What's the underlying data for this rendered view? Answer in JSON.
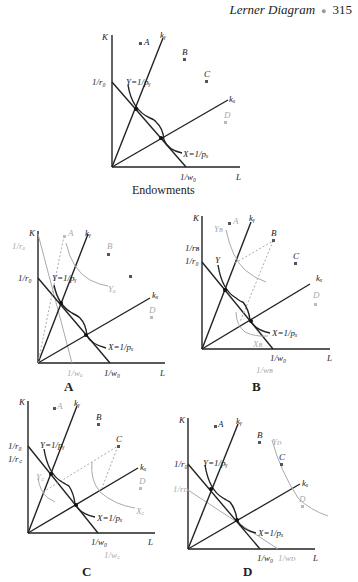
{
  "header": {
    "title": "Lerner Diagram",
    "page": "315",
    "separator": "●"
  },
  "panels": {
    "endowments": {
      "caption": "Endowments",
      "labels": {
        "k": "K",
        "l": "L",
        "r0": "1/r₀",
        "w0": "1/w₀",
        "ky": "kᵧ",
        "kx": "kₓ",
        "y": "Y=1/pᵧ",
        "x": "X=1/pₓ",
        "a": "A",
        "b": "B",
        "c": "C",
        "d": "D"
      }
    },
    "a": {
      "caption": "A",
      "labels": {
        "k": "K",
        "l": "L",
        "r0": "1/r₀",
        "ra": "1/rₐ",
        "w0": "1/w₀",
        "wa": "1/wₐ",
        "ky": "kᵧ",
        "kx": "kₓ",
        "y": "Y=1/pᵧ",
        "x": "X=1/pₓ",
        "ya": "Yₐ",
        "a": "A",
        "b": "B",
        "d": "D"
      }
    },
    "b": {
      "caption": "B",
      "labels": {
        "k": "K",
        "l": "L",
        "r0": "1/r₀",
        "rb": "1/rʙ",
        "w0": "1/w₀",
        "wb": "1/wʙ",
        "ky": "kᵧ",
        "kx": "kₓ",
        "y": "Y",
        "x": "X=1/pₓ",
        "yb": "Yʙ",
        "xb": "Xʙ",
        "a": "A",
        "b": "B",
        "c": "C",
        "d": "D"
      }
    },
    "c": {
      "caption": "C",
      "labels": {
        "k": "K",
        "l": "L",
        "r0": "1/r₀",
        "rc": "1/r꜀",
        "w0": "1/w₀",
        "wc": "1/w꜀",
        "ky": "kᵧ",
        "kx": "kₓ",
        "y": "Y=1/pᵧ",
        "x": "X=1/pₓ",
        "yc": "Y꜀",
        "xc": "X꜀",
        "a": "A",
        "b": "B",
        "c": "C",
        "d": "D"
      }
    },
    "d": {
      "caption": "D",
      "labels": {
        "k": "K",
        "l": "L",
        "r0": "1/r₀",
        "rd": "1/rᴅ",
        "w0": "1/w₀",
        "wd": "1/wᴅ",
        "ky": "kᵧ",
        "kx": "kₓ",
        "y": "Y=1/pᵧ",
        "x": "X=1/pₓ",
        "yd": "Yᴅ",
        "a": "A",
        "b": "B",
        "c": "C",
        "d": "D"
      }
    }
  }
}
